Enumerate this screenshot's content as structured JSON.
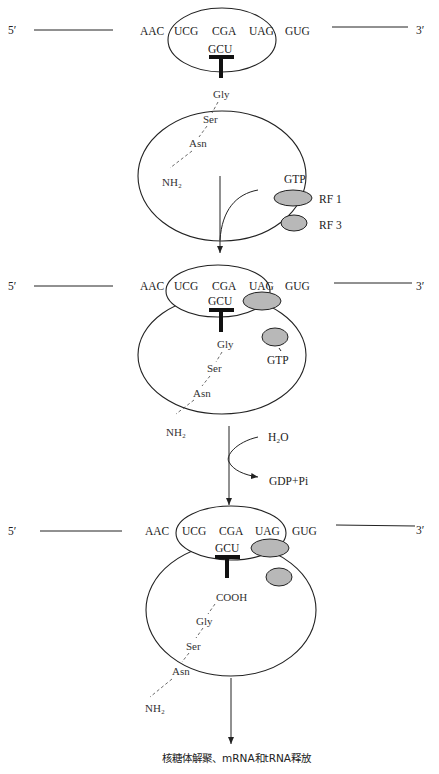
{
  "labels": {
    "five_prime": "5′",
    "three_prime": "3′",
    "codons": [
      "AAC",
      "UCG",
      "CGA",
      "UAG",
      "GUG"
    ],
    "anticodon": "GCU",
    "peptide": [
      "Gly",
      "Ser",
      "Asn"
    ],
    "nh2": "NH₂",
    "cooh": "COOH",
    "gtp": "GTP",
    "rf1": "RF 1",
    "rf3": "RF 3",
    "h2o": "H₂O",
    "gdp_pi": "GDP+Pi",
    "final": "核糖体解聚、mRNA和tRNA释放"
  },
  "colors": {
    "release_factor_fill": "#b8b8b8",
    "line": "#222222"
  }
}
